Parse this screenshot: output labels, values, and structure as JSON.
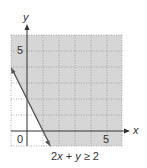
{
  "graph": {
    "x_axis_label": "x",
    "y_axis_label": "y",
    "origin_label": "0",
    "x_tick_label": "5",
    "y_tick_label": "5",
    "inequality_caption_parts": [
      "2",
      "x",
      " + ",
      "y",
      " ≥ 2"
    ],
    "inequality": "2x + y ≥ 2",
    "x_range": [
      -1,
      6
    ],
    "y_range": [
      -1,
      6
    ],
    "boundary_line": {
      "points": [
        [
          -1,
          4
        ],
        [
          1.5,
          -1
        ]
      ],
      "style": "solid"
    },
    "shaded_region": "above-right of line",
    "colors": {
      "shade": "#d6d6d6",
      "grid": "#9a9a9a",
      "axis": "#333333",
      "line": "#555555"
    }
  }
}
